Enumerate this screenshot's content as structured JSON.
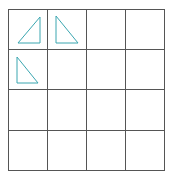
{
  "grid": {
    "rows": 4,
    "cols": 4,
    "line_color": "#555555"
  },
  "shapes": [
    {
      "type": "right-triangle",
      "cell": [
        0,
        0
      ],
      "right_angle": "bottom-right",
      "color": "#3aa6b0"
    },
    {
      "type": "right-triangle",
      "cell": [
        0,
        1
      ],
      "right_angle": "bottom-left",
      "color": "#3aa6b0"
    },
    {
      "type": "right-triangle",
      "cell": [
        1,
        0
      ],
      "right_angle": "bottom-left",
      "color": "#3aa6b0"
    }
  ]
}
